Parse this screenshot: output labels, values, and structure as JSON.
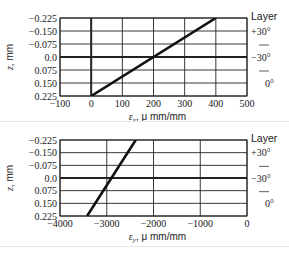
{
  "chart_data": [
    {
      "type": "line",
      "title": "",
      "xlabel": "ε_x, μ mm/mm",
      "xlabel_main": "ε",
      "xlabel_sub": "x",
      "xlabel_rest": ", μ mm/mm",
      "ylabel": "z, mm",
      "xlim": [
        -100,
        500
      ],
      "ylim": [
        0.225,
        -0.225
      ],
      "xticks": [
        -100,
        0,
        100,
        200,
        300,
        400,
        500
      ],
      "xtick_labels": [
        "−100",
        "0",
        "100",
        "200",
        "300",
        "400",
        "500"
      ],
      "yticks": [
        -0.225,
        -0.15,
        -0.075,
        0.0,
        0.075,
        0.15,
        0.225
      ],
      "ytick_labels": [
        "−0.225",
        "−0.150",
        "−0.075",
        "0.0",
        "0.075",
        "0.150",
        "0.225"
      ],
      "grid": true,
      "thick_vline_x": 0,
      "thick_hline_y": 0.0,
      "series": [
        {
          "name": "strain",
          "x": [
            0,
            400
          ],
          "y": [
            0.225,
            -0.225
          ]
        }
      ],
      "layer_legend": {
        "title": "Layer",
        "items": [
          "+30°",
          "−30°",
          "0°"
        ]
      }
    },
    {
      "type": "line",
      "title": "",
      "xlabel": "ε_y, μ mm/mm",
      "xlabel_main": "ε",
      "xlabel_sub": "y",
      "xlabel_rest": ", μ mm/mm",
      "ylabel": "z, mm",
      "xlim": [
        -4000,
        0
      ],
      "ylim": [
        0.225,
        -0.225
      ],
      "xticks": [
        -4000,
        -3000,
        -2000,
        -1000,
        0
      ],
      "xtick_labels": [
        "−4000",
        "−3000",
        "−2000",
        "−1000",
        "0"
      ],
      "yticks": [
        -0.225,
        -0.15,
        -0.075,
        0.0,
        0.075,
        0.15,
        0.225
      ],
      "ytick_labels": [
        "−0.225",
        "−0.150",
        "−0.075",
        "0.0",
        "0.075",
        "0.150",
        "0.225"
      ],
      "grid": true,
      "thick_vline_x": 0,
      "thick_hline_y": 0.0,
      "series": [
        {
          "name": "strain",
          "x": [
            -3420,
            -2380
          ],
          "y": [
            0.225,
            -0.225
          ]
        }
      ],
      "layer_legend": {
        "title": "Layer",
        "items": [
          "+30°",
          "−30°",
          "0°"
        ]
      }
    },
    {
      "type": "line",
      "title": "",
      "xlabel": "",
      "ylabel": "",
      "xlim": [
        -6,
        6
      ],
      "ylim": [
        0.225,
        -0.225
      ],
      "xticks": [],
      "ytick_labels": [
        "−0.225",
        "−0.150"
      ],
      "grid": true,
      "thick_vline_x": 0,
      "series": [
        {
          "name": "strain",
          "x": [
            1.0,
            2.8
          ],
          "y": [
            -0.09,
            -0.225
          ]
        }
      ],
      "layer_legend": {
        "title": "Layer",
        "items": [
          "+30°"
        ]
      },
      "note": "partially visible, cropped at bottom"
    }
  ]
}
